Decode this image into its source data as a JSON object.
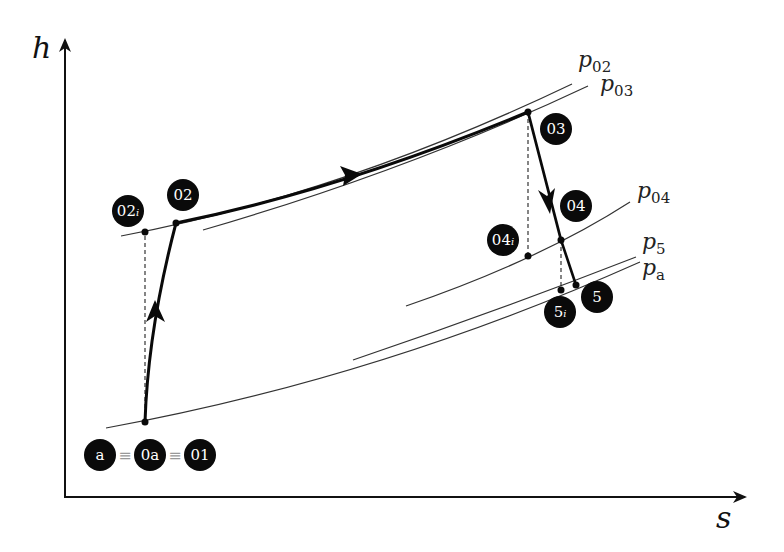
{
  "diagram": {
    "type": "h-s diagram (gas turbine cycle)",
    "axes": {
      "y_label": "h",
      "x_label": "s"
    },
    "isobars": [
      {
        "id": "p02",
        "label_main": "p",
        "label_sub": "02"
      },
      {
        "id": "p03",
        "label_main": "p",
        "label_sub": "03"
      },
      {
        "id": "p04",
        "label_main": "p",
        "label_sub": "04"
      },
      {
        "id": "p5",
        "label_main": "p",
        "label_sub": "5"
      },
      {
        "id": "pa",
        "label_main": "p",
        "label_sub": "a"
      }
    ],
    "states": {
      "a": {
        "main": "a",
        "sub": ""
      },
      "0a": {
        "main": "0a",
        "sub": ""
      },
      "01": {
        "main": "01",
        "sub": ""
      },
      "02i": {
        "main": "02",
        "sub": "i"
      },
      "02": {
        "main": "02",
        "sub": ""
      },
      "03": {
        "main": "03",
        "sub": ""
      },
      "04": {
        "main": "04",
        "sub": ""
      },
      "04i": {
        "main": "04",
        "sub": "i"
      },
      "5": {
        "main": "5",
        "sub": ""
      },
      "5i": {
        "main": "5",
        "sub": "i"
      }
    },
    "equivalence_symbol": "≡",
    "processes": [
      {
        "from": "01",
        "to": "02",
        "type": "compression",
        "direction": "up"
      },
      {
        "from": "02",
        "to": "03",
        "type": "heat addition",
        "direction": "right"
      },
      {
        "from": "03",
        "to": "04",
        "type": "expansion (turbine)",
        "direction": "down"
      },
      {
        "from": "04",
        "to": "5",
        "type": "expansion (nozzle)",
        "direction": "down"
      }
    ],
    "colors": {
      "line": "#111111",
      "isobar": "#333333",
      "badge_fill": "#0a0a0a",
      "badge_text": "#ffffff",
      "background": "#ffffff"
    }
  }
}
